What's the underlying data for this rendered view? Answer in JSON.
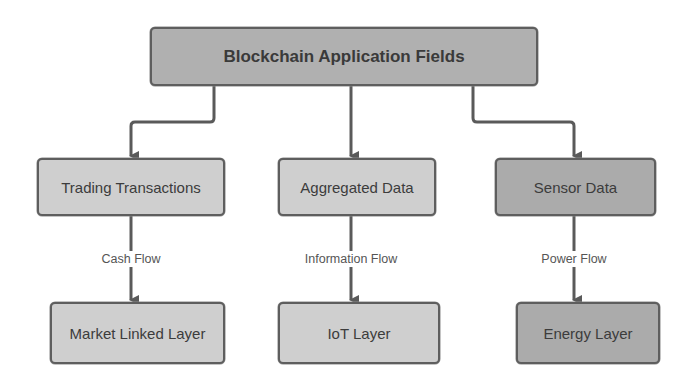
{
  "diagram": {
    "root": {
      "label": "Blockchain Application Fields"
    },
    "fields": [
      {
        "label": "Trading Transactions",
        "flow": "Cash Flow",
        "layer": "Market Linked Layer"
      },
      {
        "label": "Aggregated Data",
        "flow": "Information Flow",
        "layer": "IoT Layer"
      },
      {
        "label": "Sensor Data",
        "flow": "Power Flow",
        "layer": "Energy Layer"
      }
    ]
  },
  "colors": {
    "root_fill": "#b0b0b0",
    "light_fill": "#cfcfcf",
    "dark_fill": "#ababab",
    "stroke": "#5e5e5e",
    "text": "#3c3c3c",
    "background": "#ffffff"
  }
}
